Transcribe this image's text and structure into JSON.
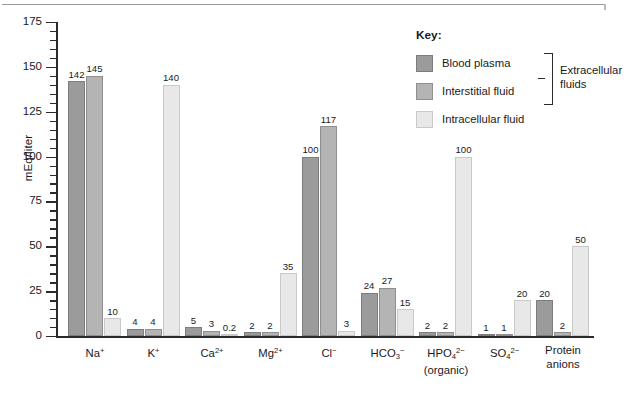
{
  "chart_data": {
    "type": "bar",
    "title": "",
    "xlabel": "",
    "ylabel": "mEq/liter",
    "ylim": [
      0,
      175
    ],
    "ytick_step": 25,
    "yticks": [
      0,
      25,
      50,
      75,
      100,
      125,
      150,
      175
    ],
    "grid": false,
    "legend_position": "top-right",
    "legend_title": "Key:",
    "brace_label": "Extracellular fluids",
    "categories": [
      "Na+",
      "K+",
      "Ca2+",
      "Mg2+",
      "Cl-",
      "HCO3-",
      "HPO42- (organic)",
      "SO42-",
      "Protein anions"
    ],
    "category_labels_html": [
      "Na<sup>+</sup>",
      "K<sup>+</sup>",
      "Ca<sup>2+</sup>",
      "Mg<sup>2+</sup>",
      "Cl<sup>−</sup>",
      "HCO<sub>3</sub><sup>−</sup>",
      "HPO<sub>4</sub><sup>2−</sup><br>(organic)",
      "SO<sub>4</sub><sup>2−</sup>",
      "Protein<br>anions"
    ],
    "series": [
      {
        "name": "Blood plasma",
        "color": "#9b9b9b",
        "values": [
          142,
          4,
          5,
          2,
          100,
          24,
          2,
          1,
          20
        ],
        "labels": [
          "142",
          "4",
          "5",
          "2",
          "100",
          "24",
          "2",
          "1",
          "20"
        ]
      },
      {
        "name": "Interstitial fluid",
        "color": "#b4b4b4",
        "values": [
          145,
          4,
          3,
          2,
          117,
          27,
          2,
          1,
          2
        ],
        "labels": [
          "145",
          "4",
          "3",
          "2",
          "117",
          "27",
          "2",
          "1",
          "2"
        ]
      },
      {
        "name": "Intracellular fluid",
        "color": "#e8e8e8",
        "values": [
          10,
          140,
          0.2,
          35,
          3,
          15,
          100,
          20,
          50
        ],
        "labels": [
          "10",
          "140",
          "0.2",
          "35",
          "3",
          "15",
          "100",
          "20",
          "50"
        ]
      }
    ]
  },
  "axis": {
    "ylabel": "mEq/liter"
  },
  "legend": {
    "title": "Key:",
    "entries": [
      {
        "label": "Blood plasma"
      },
      {
        "label": "Interstitial fluid"
      },
      {
        "label": "Intracellular fluid"
      }
    ],
    "brace_line1": "Extracellular",
    "brace_line2": "fluids"
  }
}
